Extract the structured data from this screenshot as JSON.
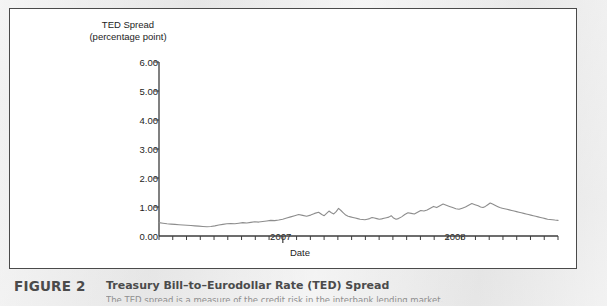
{
  "figure": {
    "number_label": "FIGURE 2",
    "title": "Treasury Bill–to–Eurodollar Rate (TED) Spread",
    "subtitle_clipped": "The TED spread is a measure of the credit risk in the interbank lending market."
  },
  "chart_data": {
    "type": "line",
    "title": "",
    "xlabel": "Date",
    "ylabel": "TED Spread",
    "ylabel_line1": "TED Spread",
    "ylabel_line2": "(percentage point)",
    "ylim": [
      0.0,
      6.0
    ],
    "ytick_labels": [
      "0.00",
      "1.00",
      "2.00",
      "3.00",
      "4.00",
      "5.00",
      "6.00"
    ],
    "ytick_values": [
      0.0,
      1.0,
      2.0,
      3.0,
      4.0,
      5.0,
      6.0
    ],
    "xtick_labels": [
      "2007",
      "2008"
    ],
    "xtick_positions": [
      0.305,
      0.742
    ],
    "grid": false,
    "legend": false,
    "line_color": "#8d8d8d",
    "axis_color": "#3c3c3c",
    "minor_xticks": 29,
    "series": [
      {
        "name": "TED Spread",
        "x": [
          0.0,
          0.01,
          0.02,
          0.03,
          0.04,
          0.05,
          0.06,
          0.07,
          0.08,
          0.09,
          0.1,
          0.11,
          0.12,
          0.13,
          0.14,
          0.15,
          0.16,
          0.17,
          0.18,
          0.19,
          0.2,
          0.21,
          0.22,
          0.23,
          0.24,
          0.25,
          0.26,
          0.27,
          0.28,
          0.29,
          0.3,
          0.31,
          0.32,
          0.33,
          0.34,
          0.35,
          0.36,
          0.37,
          0.38,
          0.39,
          0.4,
          0.408,
          0.414,
          0.42,
          0.426,
          0.432,
          0.438,
          0.444,
          0.45,
          0.456,
          0.462,
          0.468,
          0.474,
          0.48,
          0.486,
          0.492,
          0.498,
          0.504,
          0.51,
          0.516,
          0.522,
          0.528,
          0.534,
          0.54,
          0.546,
          0.552,
          0.558,
          0.564,
          0.57,
          0.576,
          0.582,
          0.588,
          0.594,
          0.6,
          0.608,
          0.616,
          0.624,
          0.632,
          0.64,
          0.648,
          0.656,
          0.664,
          0.672,
          0.68,
          0.688,
          0.696,
          0.704,
          0.712,
          0.72,
          0.728,
          0.736,
          0.744,
          0.752,
          0.76,
          0.768,
          0.776,
          0.784,
          0.792,
          0.8,
          0.806,
          0.812,
          0.818,
          0.824,
          0.83,
          0.836,
          0.842,
          0.848,
          0.854,
          0.86,
          0.866,
          0.872,
          0.878,
          0.884,
          0.89,
          0.896,
          0.902,
          0.908,
          0.914,
          0.92,
          0.926,
          0.932,
          0.938,
          0.944,
          0.95,
          0.956,
          0.962,
          0.968,
          0.974,
          0.98,
          0.986,
          0.992,
          1.0
        ],
        "y": [
          0.46,
          0.44,
          0.42,
          0.41,
          0.4,
          0.39,
          0.38,
          0.37,
          0.36,
          0.35,
          0.34,
          0.33,
          0.32,
          0.33,
          0.35,
          0.38,
          0.4,
          0.42,
          0.43,
          0.42,
          0.44,
          0.46,
          0.45,
          0.47,
          0.49,
          0.48,
          0.5,
          0.52,
          0.54,
          0.53,
          0.55,
          0.58,
          0.62,
          0.66,
          0.7,
          0.74,
          0.71,
          0.68,
          0.72,
          0.78,
          0.82,
          0.74,
          0.7,
          0.78,
          0.86,
          0.8,
          0.76,
          0.84,
          0.95,
          0.88,
          0.8,
          0.72,
          0.68,
          0.66,
          0.64,
          0.62,
          0.6,
          0.58,
          0.57,
          0.56,
          0.58,
          0.6,
          0.64,
          0.62,
          0.6,
          0.58,
          0.59,
          0.61,
          0.63,
          0.65,
          0.7,
          0.62,
          0.58,
          0.6,
          0.66,
          0.74,
          0.8,
          0.78,
          0.76,
          0.82,
          0.88,
          0.86,
          0.9,
          0.96,
          1.02,
          0.98,
          1.04,
          1.1,
          1.06,
          1.02,
          0.98,
          0.94,
          0.92,
          0.96,
          1.0,
          1.06,
          1.12,
          1.08,
          1.04,
          1.0,
          0.98,
          1.02,
          1.08,
          1.14,
          1.1,
          1.06,
          1.02,
          0.98,
          0.96,
          0.94,
          0.92,
          0.9,
          0.88,
          0.86,
          0.84,
          0.82,
          0.8,
          0.78,
          0.76,
          0.74,
          0.72,
          0.7,
          0.68,
          0.66,
          0.64,
          0.62,
          0.6,
          0.58,
          0.57,
          0.56,
          0.55,
          0.54
        ],
        "key_points": [
          {
            "label": "start (early 2006)",
            "value": 0.46
          },
          {
            "label": "2006 trough",
            "value": 0.32
          },
          {
            "label": "pre-crisis level",
            "value": 0.5
          },
          {
            "label": "Aug 2007 first spike",
            "value": 2.4
          },
          {
            "label": "late 2007 peak",
            "value": 2.25
          },
          {
            "label": "early 2008 lull",
            "value": 0.8
          },
          {
            "label": "Sep 2008 pre-rise",
            "value": 2.3
          },
          {
            "label": "Oct 2008 crisis peak",
            "value": 5.75
          },
          {
            "label": "post-peak dip",
            "value": 3.05
          },
          {
            "label": "secondary peak",
            "value": 4.0
          },
          {
            "label": "late plateau",
            "value": 3.0
          },
          {
            "label": "final value",
            "value": 1.7
          }
        ]
      }
    ]
  }
}
